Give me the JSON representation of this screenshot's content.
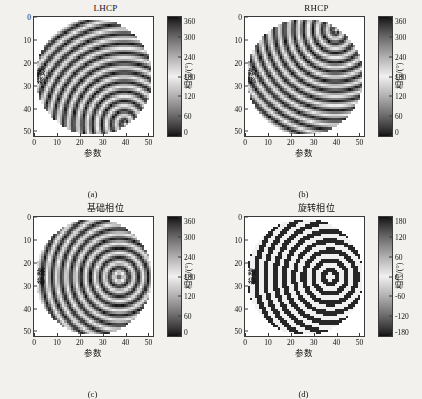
{
  "figure": {
    "background": "#f2f1ee",
    "axis_color": "#3a3a3a",
    "grid": false,
    "colormap": "cyclic-gray"
  },
  "chart_data": [
    {
      "type": "heatmap",
      "panel_id": "a",
      "title": "LHCP",
      "caption": "(a)",
      "xlabel": "参数",
      "ylabel": "参数",
      "xlim": [
        0,
        52
      ],
      "ylim": [
        0,
        52
      ],
      "xticks": [
        0,
        10,
        20,
        30,
        40,
        50
      ],
      "yticks": [
        0,
        10,
        20,
        30,
        40,
        50
      ],
      "y_axis_direction": "down",
      "colorbar": {
        "label": "相位/(°)",
        "ticks": [
          360,
          300,
          240,
          180,
          120,
          60,
          0
        ],
        "vmin": 0,
        "vmax": 360,
        "unit": "°"
      },
      "mask": "circular",
      "pattern": {
        "model": "fresnel_plus_spiral",
        "focus_x": 40,
        "focus_y": 46,
        "radial_period": 4.2,
        "spiral_charge": 1,
        "description": "Left-hand circular polarization phase: Fresnel zone rings centred near lower-right plus one spiral turn"
      }
    },
    {
      "type": "heatmap",
      "panel_id": "b",
      "title": "RHCP",
      "caption": "(b)",
      "xlabel": "参数",
      "ylabel": "参数",
      "xlim": [
        0,
        52
      ],
      "ylim": [
        0,
        52
      ],
      "xticks": [
        0,
        10,
        20,
        30,
        40,
        50
      ],
      "yticks": [
        0,
        10,
        20,
        30,
        40,
        50
      ],
      "y_axis_direction": "down",
      "colorbar": {
        "label": "相位/(°)",
        "ticks": [
          360,
          300,
          240,
          180,
          120,
          60,
          0
        ],
        "vmin": 0,
        "vmax": 360,
        "unit": "°"
      },
      "mask": "circular",
      "pattern": {
        "model": "fresnel_plus_spiral",
        "focus_x": 40,
        "focus_y": 6,
        "radial_period": 4.2,
        "spiral_charge": -1,
        "description": "Right-hand circular polarization phase: mirrored Fresnel rings centred near upper-right with opposite spiral sense"
      }
    },
    {
      "type": "heatmap",
      "panel_id": "c",
      "title": "基础相位",
      "caption": "(c)",
      "xlabel": "参数",
      "ylabel": "参数",
      "xlim": [
        0,
        52
      ],
      "ylim": [
        0,
        52
      ],
      "xticks": [
        0,
        10,
        20,
        30,
        40,
        50
      ],
      "yticks": [
        0,
        10,
        20,
        30,
        40,
        50
      ],
      "y_axis_direction": "down",
      "colorbar": {
        "label": "相位/(°)",
        "ticks": [
          360,
          300,
          240,
          180,
          120,
          60,
          0
        ],
        "vmin": 0,
        "vmax": 360,
        "unit": "°"
      },
      "mask": "circular",
      "pattern": {
        "model": "fresnel_rings",
        "focus_x": 37,
        "focus_y": 26,
        "radial_period": 4.2,
        "spiral_charge": 0,
        "description": "Base phase: concentric Fresnel rings centred right of middle, no spiral term"
      }
    },
    {
      "type": "heatmap",
      "panel_id": "d",
      "title": "旋转相位",
      "caption": "(d)",
      "xlabel": "参数",
      "ylabel": "参数",
      "xlim": [
        0,
        52
      ],
      "ylim": [
        0,
        52
      ],
      "xticks": [
        0,
        10,
        20,
        30,
        40,
        50
      ],
      "yticks": [
        0,
        10,
        20,
        30,
        40,
        50
      ],
      "y_axis_direction": "down",
      "colorbar": {
        "label": "相位/(°)",
        "ticks": [
          180,
          120,
          60,
          0,
          -60,
          -120,
          -180
        ],
        "vmin": -180,
        "vmax": 180,
        "unit": "°"
      },
      "mask": "circular",
      "pattern": {
        "model": "binary_rotation",
        "focus_x": 37,
        "focus_y": 26,
        "radial_period": 4.2,
        "levels": [
          0,
          180
        ],
        "description": "Rotation phase: binarised element-rotation map taking only 0° and 180° states"
      }
    }
  ]
}
